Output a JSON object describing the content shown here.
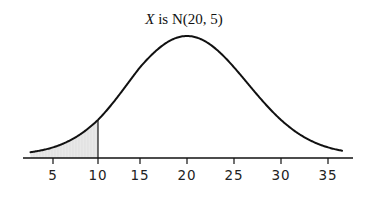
{
  "chart_data": {
    "type": "area",
    "title": "X is N(20, 5)",
    "title_parts": {
      "variable": "X",
      "rest": " is N(20, 5)"
    },
    "distribution": "normal",
    "mean": 20,
    "sd": 5,
    "xlabel": "",
    "ylabel": "",
    "xlim": [
      2.5,
      36.5
    ],
    "x_ticks": [
      5,
      10,
      15,
      20,
      25,
      30,
      35
    ],
    "x_tick_labels": [
      "5",
      "10",
      "15",
      "20",
      "25",
      "30",
      "35"
    ],
    "shaded_region": {
      "from": 2.5,
      "to": 10,
      "color": "#e6e6e6"
    },
    "cutoff_line": 10,
    "grid": false,
    "legend": null,
    "colors": {
      "curve": "#111111",
      "axis": "#111111",
      "shade": "#e6e6e6"
    }
  }
}
